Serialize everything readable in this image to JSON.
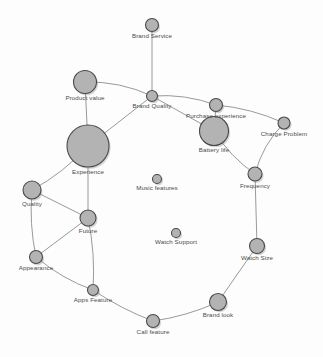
{
  "graph": {
    "title": "Attribute Co-occurrence Network",
    "background_color": "#fdfdfd",
    "node_fill_color": "#b3b3b3",
    "node_stroke_color": "#4a4a4a",
    "edge_color": "#8d8d8d",
    "label_color": "#4b4b4b",
    "width": 323,
    "height": 357,
    "nodes": [
      {
        "id": "brand_service",
        "label": "Brand Service",
        "x": 152,
        "y": 25,
        "r": 6.5
      },
      {
        "id": "product_value",
        "label": "Product value",
        "x": 85,
        "y": 82,
        "r": 11.5
      },
      {
        "id": "brand_quality",
        "label": "Brand Quality",
        "x": 152,
        "y": 96,
        "r": 5.5
      },
      {
        "id": "purchase_experience",
        "label": "Purchase experience",
        "x": 216,
        "y": 105,
        "r": 6.5
      },
      {
        "id": "charge_problem",
        "label": "Charge Problem",
        "x": 284,
        "y": 123,
        "r": 6.0
      },
      {
        "id": "battery_life",
        "label": "Battery life",
        "x": 214,
        "y": 131,
        "r": 14.5
      },
      {
        "id": "experience",
        "label": "Experience",
        "x": 88,
        "y": 146,
        "r": 21.0
      },
      {
        "id": "frequency",
        "label": "Frequency",
        "x": 255,
        "y": 174,
        "r": 7.0
      },
      {
        "id": "music_features",
        "label": "Music features",
        "x": 157,
        "y": 179,
        "r": 4.5
      },
      {
        "id": "quality",
        "label": "Quality",
        "x": 32,
        "y": 190,
        "r": 9.0
      },
      {
        "id": "future",
        "label": "Future",
        "x": 88,
        "y": 218,
        "r": 8.0
      },
      {
        "id": "watch_support",
        "label": "Watch Support",
        "x": 176,
        "y": 233,
        "r": 4.5
      },
      {
        "id": "watch_size",
        "label": "Watch Size",
        "x": 257,
        "y": 246,
        "r": 7.5
      },
      {
        "id": "appearance",
        "label": "Appearance",
        "x": 36,
        "y": 257,
        "r": 6.5
      },
      {
        "id": "apps_feature",
        "label": "Apps Feature",
        "x": 93,
        "y": 290,
        "r": 5.5
      },
      {
        "id": "brand_look",
        "label": "Brand look",
        "x": 218,
        "y": 302,
        "r": 8.5
      },
      {
        "id": "call_feature",
        "label": "Call feature",
        "x": 153,
        "y": 321,
        "r": 6.5
      }
    ],
    "edges": [
      {
        "source": "brand_service",
        "target": "brand_quality",
        "curve": 0
      },
      {
        "source": "product_value",
        "target": "brand_quality",
        "curve": -8
      },
      {
        "source": "product_value",
        "target": "experience",
        "curve": 0
      },
      {
        "source": "brand_quality",
        "target": "experience",
        "curve": 0
      },
      {
        "source": "brand_quality",
        "target": "purchase_experience",
        "curve": -7
      },
      {
        "source": "brand_quality",
        "target": "battery_life",
        "curve": 0
      },
      {
        "source": "purchase_experience",
        "target": "battery_life",
        "curve": 0
      },
      {
        "source": "purchase_experience",
        "target": "charge_problem",
        "curve": -6
      },
      {
        "source": "charge_problem",
        "target": "frequency",
        "curve": 8
      },
      {
        "source": "battery_life",
        "target": "frequency",
        "curve": 6
      },
      {
        "source": "frequency",
        "target": "watch_size",
        "curve": 0
      },
      {
        "source": "watch_size",
        "target": "brand_look",
        "curve": 0
      },
      {
        "source": "brand_look",
        "target": "call_feature",
        "curve": -5
      },
      {
        "source": "call_feature",
        "target": "apps_feature",
        "curve": -4
      },
      {
        "source": "apps_feature",
        "target": "future",
        "curve": 5
      },
      {
        "source": "apps_feature",
        "target": "appearance",
        "curve": -6
      },
      {
        "source": "appearance",
        "target": "quality",
        "curve": -5
      },
      {
        "source": "appearance",
        "target": "future",
        "curve": 0
      },
      {
        "source": "quality",
        "target": "future",
        "curve": 0
      },
      {
        "source": "quality",
        "target": "experience",
        "curve": 6
      },
      {
        "source": "experience",
        "target": "future",
        "curve": 0
      }
    ],
    "isolated_nodes": [
      "music_features",
      "watch_support"
    ]
  }
}
